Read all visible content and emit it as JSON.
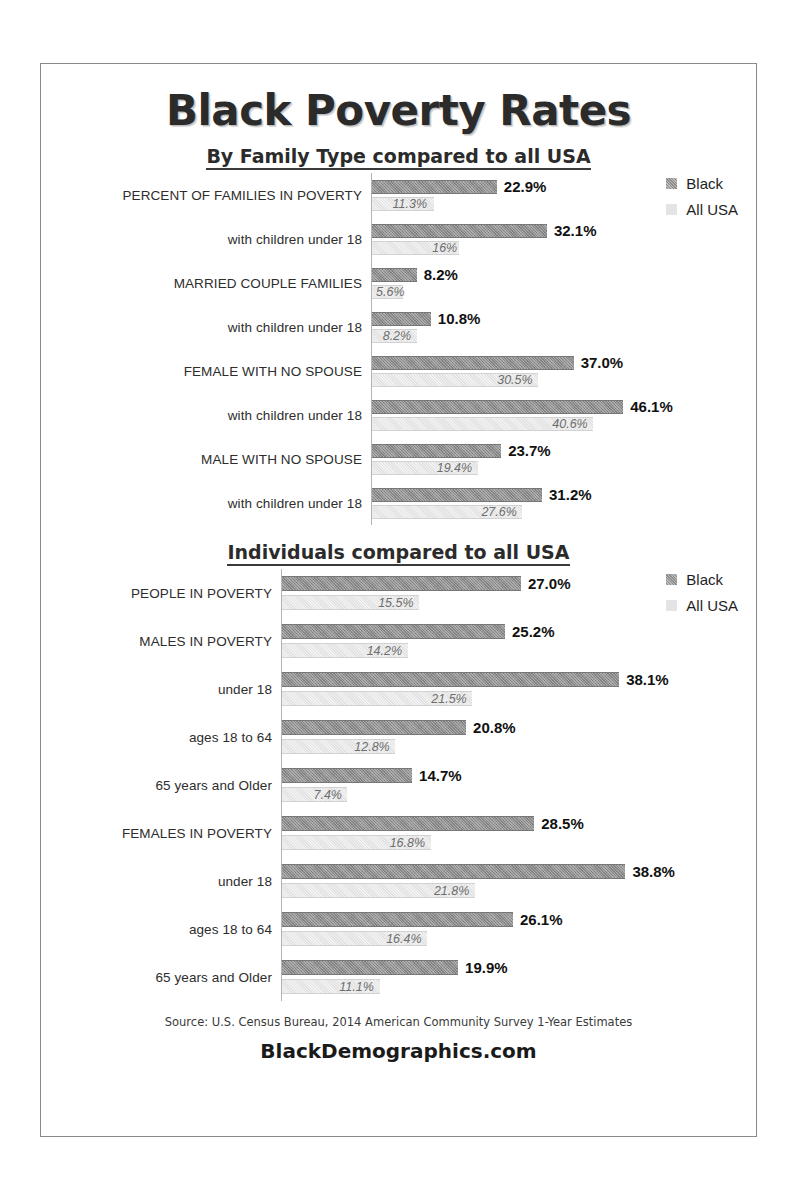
{
  "poster": {
    "title": "Black Poverty Rates",
    "source": "Source: U.S. Census Bureau, 2014 American Community Survey 1-Year Estimates",
    "brand": "BlackDemographics.com",
    "colors": {
      "black_series": "#8d8d8d",
      "allusa_series": "#e2e2e2",
      "border": "#8a8a8a",
      "text": "#1a1a1a"
    }
  },
  "legend": {
    "black_label": "Black",
    "allusa_label": "All USA"
  },
  "chart_data": [
    {
      "type": "bar",
      "title": "By Family Type compared to all USA",
      "orientation": "horizontal",
      "xlabel": "",
      "ylabel": "",
      "grid": false,
      "legend_position": "top-right",
      "xlim": [
        0,
        50
      ],
      "categories": [
        "PERCENT OF FAMILIES IN POVERTY",
        "with children under 18",
        "MARRIED COUPLE FAMILIES",
        "with children under 18",
        "FEMALE WITH NO SPOUSE",
        "with children under 18",
        "MALE WITH NO SPOUSE",
        "with children under 18"
      ],
      "series": [
        {
          "name": "Black",
          "values": [
            22.9,
            32.1,
            8.2,
            10.8,
            37.0,
            46.1,
            23.7,
            31.2
          ],
          "labels": [
            "22.9%",
            "32.1%",
            "8.2%",
            "10.8%",
            "37.0%",
            "46.1%",
            "23.7%",
            "31.2%"
          ]
        },
        {
          "name": "All USA",
          "values": [
            11.3,
            16.0,
            5.6,
            8.2,
            30.5,
            40.6,
            19.4,
            27.6
          ],
          "labels": [
            "11.3%",
            "16%",
            "5.6%",
            "8.2%",
            "30.5%",
            "40.6%",
            "19.4%",
            "27.6%"
          ]
        }
      ]
    },
    {
      "type": "bar",
      "title": "Individuals compared to all USA",
      "orientation": "horizontal",
      "xlabel": "",
      "ylabel": "",
      "grid": false,
      "legend_position": "top-right",
      "xlim": [
        0,
        40
      ],
      "categories": [
        "PEOPLE IN POVERTY",
        "MALES IN POVERTY",
        "under 18",
        "ages 18 to 64",
        "65 years and Older",
        "FEMALES IN POVERTY",
        "under 18",
        "ages 18 to 64",
        "65 years and Older"
      ],
      "series": [
        {
          "name": "Black",
          "values": [
            27.0,
            25.2,
            38.1,
            20.8,
            14.7,
            28.5,
            38.8,
            26.1,
            19.9
          ],
          "labels": [
            "27.0%",
            "25.2%",
            "38.1%",
            "20.8%",
            "14.7%",
            "28.5%",
            "38.8%",
            "26.1%",
            "19.9%"
          ]
        },
        {
          "name": "All USA",
          "values": [
            15.5,
            14.2,
            21.5,
            12.8,
            7.4,
            16.8,
            21.8,
            16.4,
            11.1
          ],
          "labels": [
            "15.5%",
            "14.2%",
            "21.5%",
            "12.8%",
            "7.4%",
            "16.8%",
            "21.8%",
            "16.4%",
            "11.1%"
          ]
        }
      ]
    }
  ]
}
